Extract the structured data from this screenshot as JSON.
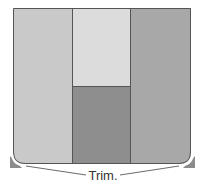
{
  "diagram": {
    "type": "panel-layout",
    "panels": [
      {
        "id": "left",
        "color": "#c9c9c9"
      },
      {
        "id": "middle-top",
        "color": "#dcdcdc"
      },
      {
        "id": "middle-bottom",
        "color": "#8e8e8e"
      },
      {
        "id": "right",
        "color": "#a8a8a8"
      }
    ],
    "border_color": "#555555",
    "trim_color": "#8c8c8c",
    "callout": {
      "label": "Trim."
    }
  }
}
